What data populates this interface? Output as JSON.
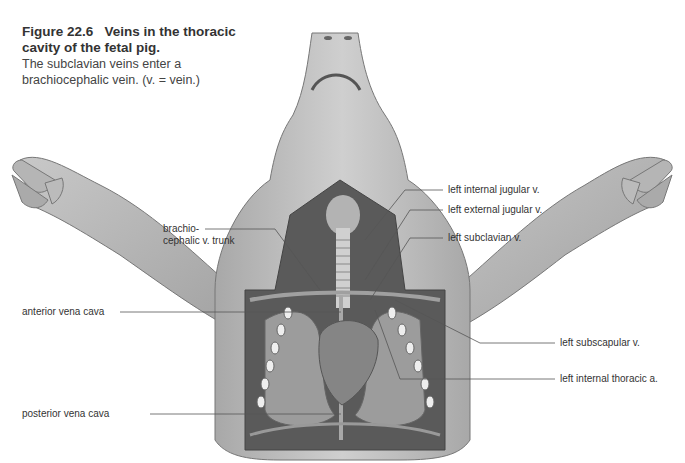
{
  "figure": {
    "number": "Figure 22.6",
    "title": "Veins in the thoracic cavity of the fetal pig.",
    "description": "The subclavian veins enter a brachiocephalic vein. (v. = vein.)"
  },
  "labels": {
    "left": [
      {
        "id": "brachiocephalic",
        "line1": "brachio-",
        "line2": "cephalic v. trunk"
      },
      {
        "id": "anterior-vena-cava",
        "text": "anterior vena cava"
      },
      {
        "id": "posterior-vena-cava",
        "text": "posterior vena cava"
      }
    ],
    "right": [
      {
        "id": "left-internal-jugular",
        "text": "left internal jugular v."
      },
      {
        "id": "left-external-jugular",
        "text": "left external jugular v."
      },
      {
        "id": "left-subclavian",
        "text": "left subclavian v."
      },
      {
        "id": "left-subscapular",
        "text": "left subscapular v."
      },
      {
        "id": "left-internal-thoracic",
        "text": "left internal thoracic a."
      }
    ]
  },
  "colors": {
    "skin": "#b9b9b9",
    "skin_dark": "#8a8a8a",
    "cavity": "#5a5a5a",
    "organ": "#9c9c9c",
    "leader_line": "#555555",
    "text": "#333333"
  }
}
